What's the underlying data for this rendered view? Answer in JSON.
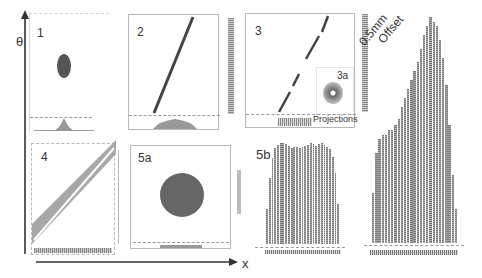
{
  "figure": {
    "axes": {
      "y_label": "θ",
      "x_label": "x"
    },
    "panels": [
      {
        "id": "1",
        "label": "1",
        "description": "small ellipse in phase space with narrow projection"
      },
      {
        "id": "2",
        "label": "2",
        "description": "thin tilted line (sheared distribution)"
      },
      {
        "id": "3",
        "label": "3",
        "description": "fragmented tilted line"
      },
      {
        "id": "3a",
        "label": "3a",
        "description": "inset ring distribution"
      },
      {
        "id": "projections",
        "label": "Projections"
      },
      {
        "id": "4",
        "label": "4",
        "description": "broad tilted band with white line"
      },
      {
        "id": "5a",
        "label": "5a",
        "description": "filled disk"
      },
      {
        "id": "5b",
        "label": "5b",
        "description": "flat-top histogram"
      },
      {
        "id": "offset",
        "label": "0.5mm Offset",
        "line1": "0.5mm",
        "line2": "Offset",
        "description": "asymmetric histogram"
      }
    ]
  },
  "colors": {
    "line": "#555555",
    "fill": "#777777",
    "bar": "#8a8a8a",
    "border": "#b8b8b8"
  },
  "chart_data": [
    {
      "type": "bar",
      "title": "5b",
      "categories": [
        "1",
        "2",
        "3",
        "4",
        "5",
        "6",
        "7",
        "8",
        "9",
        "10",
        "11",
        "12",
        "13",
        "14",
        "15",
        "16",
        "17",
        "18",
        "19",
        "20",
        "21",
        "22",
        "23",
        "24",
        "25",
        "26",
        "27",
        "28",
        "29",
        "30",
        "31",
        "32",
        "33",
        "34",
        "35"
      ],
      "values": [
        35,
        65,
        85,
        95,
        98,
        100,
        100,
        99,
        97,
        95,
        96,
        96,
        95,
        96,
        97,
        98,
        100,
        99,
        97,
        99,
        100,
        98,
        96,
        94,
        86,
        70,
        40
      ]
    },
    {
      "type": "bar",
      "title": "0.5mm Offset",
      "values": [
        22,
        40,
        46,
        48,
        48,
        50,
        50,
        52,
        55,
        60,
        64,
        68,
        72,
        76,
        80,
        86,
        92,
        96,
        100,
        98,
        96,
        90,
        82,
        70,
        52,
        30,
        15
      ]
    }
  ]
}
